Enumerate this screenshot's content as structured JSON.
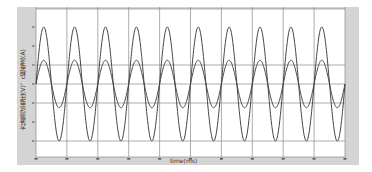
{
  "chart_data": {
    "type": "line",
    "title": "",
    "xlabel": "time(ms)",
    "ylabel": "方波测试电压(V)、c相电流(A)",
    "xlim": [
      0,
      100
    ],
    "ylim": [
      -400,
      400
    ],
    "x_ticks": [
      0,
      10,
      20,
      30,
      40,
      50,
      60,
      70,
      80,
      90,
      100
    ],
    "y_ticks": [
      300,
      200,
      100,
      0,
      -100,
      -200,
      -300
    ],
    "grid": {
      "vertical": true,
      "horizontal_at": [
        100,
        0,
        -100,
        -300
      ]
    },
    "legend": null,
    "series": [
      {
        "name": "电压(V)",
        "waveform": "sine",
        "amplitude": 300,
        "offset": 0,
        "period_ms": 10,
        "phase_deg": 0,
        "color": "#444444"
      },
      {
        "name": "电流(A)",
        "waveform": "sine",
        "amplitude": 125,
        "offset": 0,
        "period_ms": 10,
        "phase_deg": 0,
        "color": "#444444"
      }
    ]
  },
  "colors": {
    "frame": "#d4d4d4",
    "plot_bg": "#ffffff",
    "grid": "#8a8a8a",
    "line": "#444444"
  }
}
